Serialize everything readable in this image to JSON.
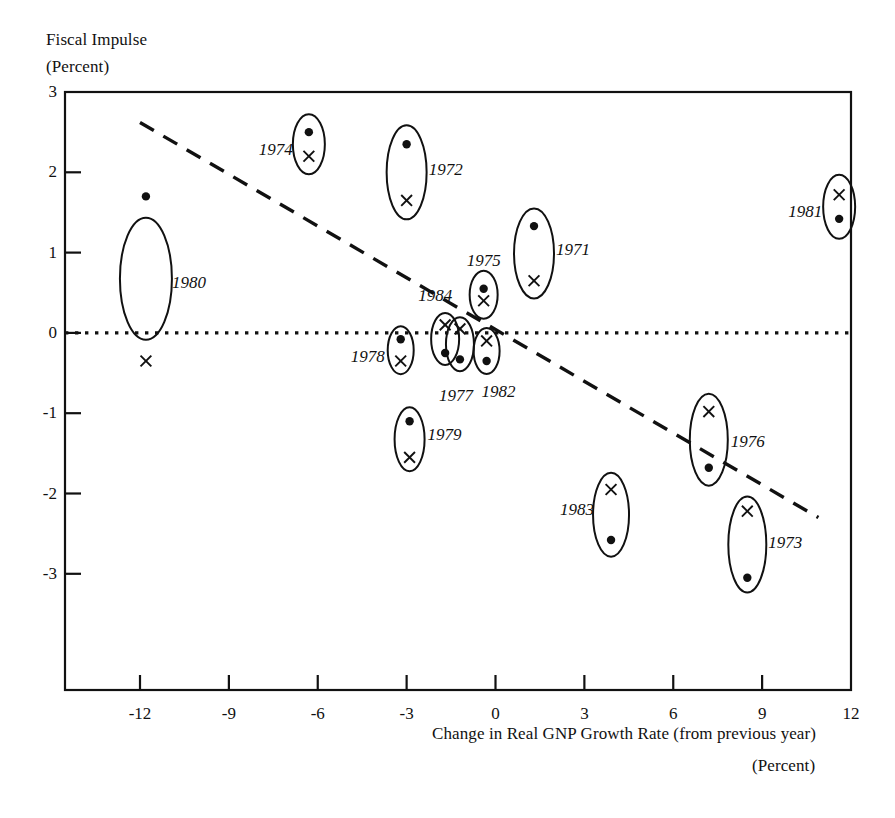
{
  "chart_data": {
    "type": "scatter",
    "title": "",
    "ylabel_line1": "Fiscal Impulse",
    "ylabel_line2": "(Percent)",
    "xlabel_line1": "Change in Real GNP Growth Rate (from previous year)",
    "xlabel_line2": "(Percent)",
    "xlim": [
      -13.5,
      12.6
    ],
    "ylim": [
      -3.8,
      3.0
    ],
    "xticks": [
      -12,
      -9,
      -6,
      -3,
      0,
      3,
      6,
      9,
      12
    ],
    "xtick_labels": [
      "-12",
      "-9",
      "-6",
      "-3",
      "0",
      "3",
      "6",
      "9",
      "12"
    ],
    "yticks": [
      3,
      2,
      1,
      0,
      -1,
      -2,
      -3
    ],
    "ytick_labels": [
      "3",
      "2",
      "1",
      "0",
      "-1",
      "-2",
      "-3"
    ],
    "grid": false,
    "legend": "none",
    "zero_line": {
      "y": 0,
      "style": "dotted",
      "color": "#111111"
    },
    "trend_line": {
      "style": "dashed",
      "color": "#111111",
      "x_start": -12.0,
      "y_start": 2.62,
      "x_end": 10.9,
      "y_end": -2.3
    },
    "marker_legend": {
      "dot": "filled circle marker",
      "cross": "x marker",
      "ellipse": "ellipse grouping the two markers for each year"
    },
    "points": [
      {
        "year": "1980",
        "x": -11.8,
        "dot": 1.7,
        "cross": -0.35,
        "label_pos": "right",
        "label_dx": 26,
        "label_dy": 0.62,
        "rx": 26,
        "ry": 61
      },
      {
        "year": "1974",
        "x": -6.3,
        "dot": 2.5,
        "cross": 2.2,
        "label_pos": "left",
        "label_dx": -16,
        "label_dy": 2.28,
        "rx": 16,
        "ry": 30
      },
      {
        "year": "1972",
        "x": -3.0,
        "dot": 2.35,
        "cross": 1.65,
        "label_pos": "right",
        "label_dx": 22,
        "label_dy": 2.03,
        "rx": 20,
        "ry": 47
      },
      {
        "year": "1971",
        "x": 1.3,
        "dot": 1.33,
        "cross": 0.65,
        "label_pos": "right",
        "label_dx": 22,
        "label_dy": 1.03,
        "rx": 20,
        "ry": 45
      },
      {
        "year": "1981",
        "x": 11.6,
        "dot": 1.42,
        "cross": 1.72,
        "label_pos": "left",
        "label_dx": -17,
        "label_dy": 1.5,
        "rx": 16,
        "ry": 32
      },
      {
        "year": "1975",
        "x": -0.4,
        "dot": 0.55,
        "cross": 0.4,
        "label_pos": "above",
        "label_dx": 0,
        "label_dy": 0.9,
        "rx": 14,
        "ry": 24
      },
      {
        "year": "1984",
        "x": -1.7,
        "dot": -0.25,
        "cross": 0.1,
        "label_pos": "above",
        "label_dx": -10,
        "label_dy": 0.46,
        "rx": 14,
        "ry": 26
      },
      {
        "year": "1978",
        "x": -3.2,
        "dot": -0.08,
        "cross": -0.35,
        "label_pos": "left",
        "label_dx": -16,
        "label_dy": -0.3,
        "rx": 13,
        "ry": 24
      },
      {
        "year": "1977",
        "x": -1.2,
        "dot": -0.33,
        "cross": 0.05,
        "label_pos": "below",
        "label_dx": -4,
        "label_dy": -0.78,
        "rx": 14,
        "ry": 27
      },
      {
        "year": "1982",
        "x": -0.3,
        "dot": -0.35,
        "cross": -0.1,
        "label_pos": "below",
        "label_dx": 12,
        "label_dy": -0.74,
        "rx": 13,
        "ry": 23
      },
      {
        "year": "1979",
        "x": -2.9,
        "dot": -1.1,
        "cross": -1.55,
        "label_pos": "right",
        "label_dx": 18,
        "label_dy": -1.27,
        "rx": 15,
        "ry": 32
      },
      {
        "year": "1976",
        "x": 7.2,
        "dot": -1.68,
        "cross": -0.98,
        "label_pos": "right",
        "label_dx": 22,
        "label_dy": -1.36,
        "rx": 19,
        "ry": 46
      },
      {
        "year": "1983",
        "x": 3.9,
        "dot": -2.58,
        "cross": -1.95,
        "label_pos": "left",
        "label_dx": -17,
        "label_dy": -2.2,
        "rx": 18,
        "ry": 42
      },
      {
        "year": "1973",
        "x": 8.5,
        "dot": -3.05,
        "cross": -2.22,
        "label_pos": "right",
        "label_dx": 21,
        "label_dy": -2.62,
        "rx": 19,
        "ry": 48
      }
    ]
  }
}
